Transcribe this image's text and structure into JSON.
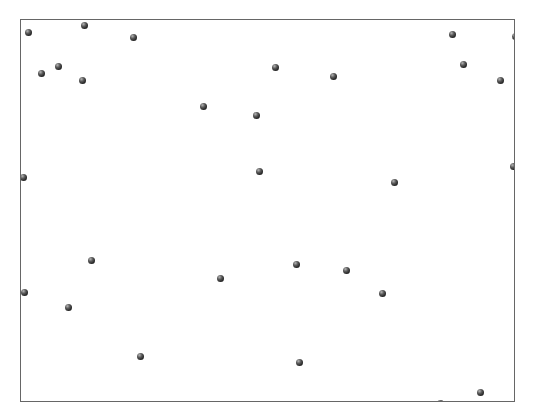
{
  "chart_data": {
    "type": "scatter",
    "title": "",
    "xlabel": "",
    "ylabel": "",
    "grid": false,
    "legend": null,
    "frame": {
      "left": 20,
      "top": 19,
      "right": 515,
      "bottom": 402
    },
    "point_color": "#2a2a2a",
    "border_color": "#666666",
    "note": "Coordinates are pixel positions in the screenshot (no axis ticks are shown).",
    "points": [
      {
        "x": 27,
        "y": 31
      },
      {
        "x": 83,
        "y": 24
      },
      {
        "x": 132,
        "y": 36
      },
      {
        "x": 40,
        "y": 72
      },
      {
        "x": 57,
        "y": 65
      },
      {
        "x": 81,
        "y": 79
      },
      {
        "x": 202,
        "y": 105
      },
      {
        "x": 255,
        "y": 114
      },
      {
        "x": 274,
        "y": 66
      },
      {
        "x": 332,
        "y": 75
      },
      {
        "x": 451,
        "y": 33
      },
      {
        "x": 514,
        "y": 35
      },
      {
        "x": 462,
        "y": 63
      },
      {
        "x": 499,
        "y": 79
      },
      {
        "x": 22,
        "y": 176
      },
      {
        "x": 258,
        "y": 170
      },
      {
        "x": 393,
        "y": 181
      },
      {
        "x": 512,
        "y": 165
      },
      {
        "x": 90,
        "y": 259
      },
      {
        "x": 219,
        "y": 277
      },
      {
        "x": 295,
        "y": 263
      },
      {
        "x": 345,
        "y": 269
      },
      {
        "x": 381,
        "y": 292
      },
      {
        "x": 23,
        "y": 291
      },
      {
        "x": 67,
        "y": 306
      },
      {
        "x": 139,
        "y": 355
      },
      {
        "x": 298,
        "y": 361
      },
      {
        "x": 479,
        "y": 391
      },
      {
        "x": 439,
        "y": 402
      }
    ]
  }
}
